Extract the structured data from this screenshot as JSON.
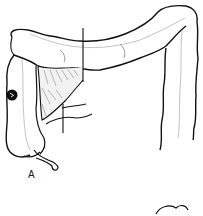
{
  "figure": {
    "type": "surgical line illustration",
    "panel_label": "A",
    "parts": [
      "transverse colon",
      "ascending colon",
      "cecum",
      "appendix",
      "descending colon",
      "mesentery (shaded resection wedge)",
      "tumor",
      "resection lines",
      "ileum"
    ],
    "colors": {
      "ink": "#111111",
      "vessel": "#9a9a9a",
      "background": "#ffffff"
    }
  }
}
